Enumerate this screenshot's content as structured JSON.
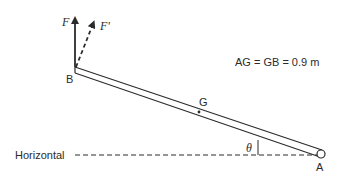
{
  "diagram": {
    "labels": {
      "force_f": "F",
      "force_f_prime": "F'",
      "point_b": "B",
      "point_g": "G",
      "point_a": "A",
      "angle": "θ",
      "horizontal": "Horizontal",
      "dimension_note": "AG = GB = 0.9 m"
    },
    "colors": {
      "line": "#2b2b2b",
      "background": "#ffffff"
    }
  }
}
